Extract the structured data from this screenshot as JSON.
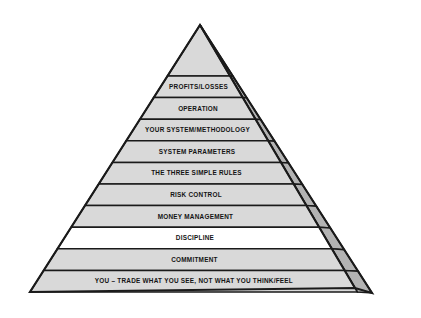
{
  "diagram": {
    "type": "layered-pyramid-3d",
    "background_color": "#ffffff",
    "front_face_color": "#d9d9d9",
    "side_face_color": "#b3b3b3",
    "highlight_tier_color": "#ffffff",
    "outline_color": "#1a1a1a",
    "text_color": "#141414",
    "tier_count": 10,
    "apex": {
      "x": 200,
      "y": 25
    },
    "base_left": {
      "x": 30,
      "y": 292
    },
    "base_right_front": {
      "x": 355,
      "y": 288
    },
    "base_right_side": {
      "x": 372,
      "y": 293
    },
    "tiers": [
      {
        "index": 1,
        "label": "PROFITS/LOSSES",
        "position": "top",
        "fill": "#d9d9d9",
        "font_size": 6.4
      },
      {
        "index": 2,
        "label": "OPERATION",
        "position": "2",
        "fill": "#d9d9d9",
        "font_size": 6.4
      },
      {
        "index": 3,
        "label": "YOUR SYSTEM/METHODOLOGY",
        "position": "3",
        "fill": "#d9d9d9",
        "font_size": 6.4
      },
      {
        "index": 4,
        "label": "SYSTEM PARAMETERS",
        "position": "4",
        "fill": "#d9d9d9",
        "font_size": 6.4
      },
      {
        "index": 5,
        "label": "THE THREE SIMPLE RULES",
        "position": "5",
        "fill": "#d9d9d9",
        "font_size": 6.4
      },
      {
        "index": 6,
        "label": "RISK CONTROL",
        "position": "6",
        "fill": "#d9d9d9",
        "font_size": 6.4
      },
      {
        "index": 7,
        "label": "MONEY MANAGEMENT",
        "position": "7",
        "fill": "#d9d9d9",
        "font_size": 6.4
      },
      {
        "index": 8,
        "label": "DISCIPLINE",
        "position": "8",
        "fill": "#ffffff",
        "font_size": 6.4
      },
      {
        "index": 9,
        "label": "COMMITMENT",
        "position": "9",
        "fill": "#d9d9d9",
        "font_size": 6.4
      },
      {
        "index": 10,
        "label": "YOU – TRADE WHAT YOU SEE, NOT WHAT YOU THINK/FEEL",
        "position": "base",
        "fill": "#d9d9d9",
        "font_size": 6.4
      }
    ]
  }
}
